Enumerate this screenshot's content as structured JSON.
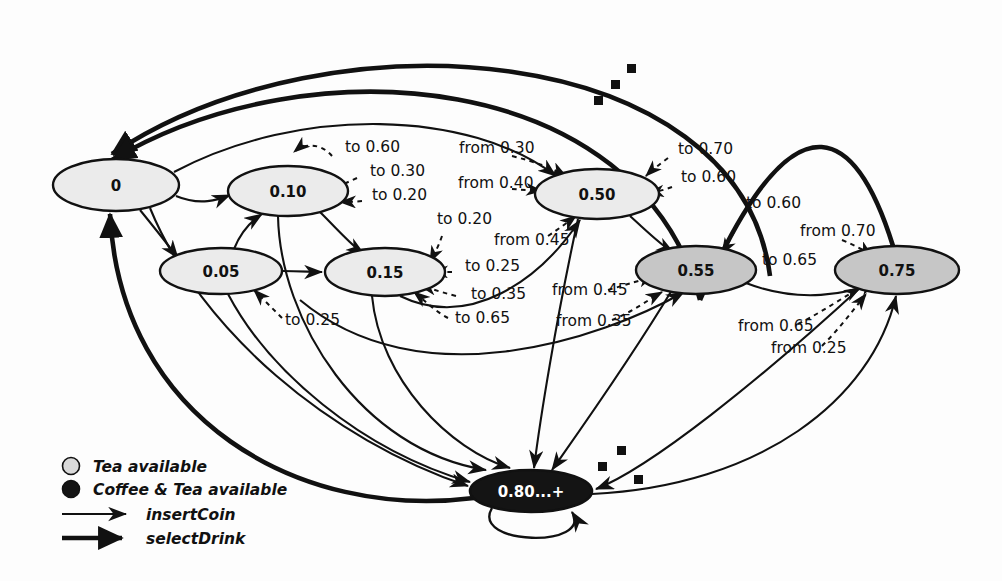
{
  "diagram": {
    "background": "#fdfdfd",
    "ink": "#111111",
    "fill_tea": "#ebebeb",
    "fill_coffee_tea_gray": "#c6c6c6",
    "fill_final": "#141414",
    "final_text_color": "#ffffff"
  },
  "states": [
    {
      "id": "s0",
      "label": "0",
      "cx": 116,
      "cy": 185,
      "rx": 63,
      "ry": 26,
      "fill": "#ebebeb",
      "text": "#111111"
    },
    {
      "id": "s005",
      "label": "0.05",
      "cx": 221,
      "cy": 271,
      "rx": 61,
      "ry": 23,
      "fill": "#ebebeb",
      "text": "#111111"
    },
    {
      "id": "s010",
      "label": "0.10",
      "cx": 288,
      "cy": 191,
      "rx": 60,
      "ry": 25,
      "fill": "#ebebeb",
      "text": "#111111"
    },
    {
      "id": "s015",
      "label": "0.15",
      "cx": 385,
      "cy": 272,
      "rx": 60,
      "ry": 24,
      "fill": "#ebebeb",
      "text": "#111111"
    },
    {
      "id": "s050",
      "label": "0.50",
      "cx": 597,
      "cy": 194,
      "rx": 62,
      "ry": 25,
      "fill": "#ebebeb",
      "text": "#111111"
    },
    {
      "id": "s055",
      "label": "0.55",
      "cx": 696,
      "cy": 270,
      "rx": 60,
      "ry": 24,
      "fill": "#c6c6c6",
      "text": "#111111"
    },
    {
      "id": "s075",
      "label": "0.75",
      "cx": 897,
      "cy": 270,
      "rx": 62,
      "ry": 24,
      "fill": "#c6c6c6",
      "text": "#111111"
    },
    {
      "id": "sfin",
      "label": "0.80...+",
      "cx": 531,
      "cy": 491,
      "rx": 61,
      "ry": 21,
      "fill": "#141414",
      "text": "#ffffff"
    }
  ],
  "edge_labels": [
    {
      "text": "to 0.60",
      "x": 345,
      "y": 152,
      "kind": "to"
    },
    {
      "text": "to 0.30",
      "x": 370,
      "y": 176,
      "kind": "to"
    },
    {
      "text": "to 0.20",
      "x": 372,
      "y": 200,
      "kind": "to"
    },
    {
      "text": "to 0.20",
      "x": 437,
      "y": 224,
      "kind": "to"
    },
    {
      "text": "to 0.25",
      "x": 465,
      "y": 271,
      "kind": "to"
    },
    {
      "text": "to 0.35",
      "x": 471,
      "y": 299,
      "kind": "to"
    },
    {
      "text": "to 0.65",
      "x": 455,
      "y": 323,
      "kind": "to"
    },
    {
      "text": "to 0.25",
      "x": 285,
      "y": 325,
      "kind": "to"
    },
    {
      "text": "from 0.30",
      "x": 459,
      "y": 153,
      "kind": "from"
    },
    {
      "text": "from 0.40",
      "x": 458,
      "y": 188,
      "kind": "from"
    },
    {
      "text": "from 0.45",
      "x": 494,
      "y": 245,
      "kind": "from"
    },
    {
      "text": "from 0.45",
      "x": 552,
      "y": 295,
      "kind": "from"
    },
    {
      "text": "from 0.35",
      "x": 556,
      "y": 326,
      "kind": "from"
    },
    {
      "text": "to 0.70",
      "x": 678,
      "y": 154,
      "kind": "to"
    },
    {
      "text": "to 0.60",
      "x": 681,
      "y": 182,
      "kind": "to"
    },
    {
      "text": "to 0.60",
      "x": 746,
      "y": 208,
      "kind": "to"
    },
    {
      "text": "to 0.65",
      "x": 762,
      "y": 265,
      "kind": "to"
    },
    {
      "text": "from 0.70",
      "x": 800,
      "y": 236,
      "kind": "from"
    },
    {
      "text": "from 0.65",
      "x": 738,
      "y": 331,
      "kind": "from"
    },
    {
      "text": "from 0.25",
      "x": 771,
      "y": 353,
      "kind": "from"
    }
  ],
  "legend": {
    "items": [
      {
        "marker": "circle-light",
        "label": "Tea available",
        "color": "#d9d9d9"
      },
      {
        "marker": "circle-dark",
        "label": "Coffee & Tea available",
        "color": "#141414"
      },
      {
        "marker": "arrow-thin",
        "label": "insertCoin",
        "color": "#111111"
      },
      {
        "marker": "arrow-thick",
        "label": "selectDrink",
        "color": "#111111"
      }
    ]
  },
  "ellipsis_groups": [
    {
      "name": "top-ellipsis",
      "dots": [
        [
          594,
          96
        ],
        [
          611,
          80
        ],
        [
          627,
          64
        ]
      ]
    },
    {
      "name": "bottom-ellipsis",
      "dots": [
        [
          598,
          462
        ],
        [
          617,
          446
        ],
        [
          634,
          475
        ]
      ]
    }
  ]
}
